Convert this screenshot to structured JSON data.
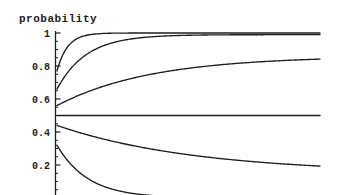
{
  "window": {
    "width": 345,
    "height": 195,
    "background": "#ffffff"
  },
  "colors": {
    "ink": "#1e1e1e"
  },
  "chart_data": {
    "type": "line",
    "title": "probability",
    "ylabel": "probability",
    "xlabel": "",
    "ylim": [
      0,
      1.02
    ],
    "grid": "off",
    "legend": "none",
    "x_axis": {
      "visible": false,
      "note": "x axis and its tick labels are cropped out of the visible image"
    },
    "y_axis": {
      "ticks": [
        {
          "value": 1.0,
          "label": "1"
        },
        {
          "value": 0.8,
          "label": "0.8"
        },
        {
          "value": 0.6,
          "label": "0.6"
        },
        {
          "value": 0.4,
          "label": "0.4"
        },
        {
          "value": 0.2,
          "label": "0.2"
        }
      ],
      "minor_tick_step": 0.05
    },
    "series": [
      {
        "name": "curve-start-0.77",
        "description": "rises steeply and saturates near 1",
        "start_value": 0.77,
        "end_value": 1.0,
        "asymptote": 1.0,
        "rate": 25,
        "x_range": [
          0,
          1
        ]
      },
      {
        "name": "curve-start-0.66",
        "description": "rises and approaches 1 more slowly",
        "start_value": 0.66,
        "end_value": 0.99,
        "asymptote": 0.99,
        "rate": 9,
        "x_range": [
          0,
          1
        ]
      },
      {
        "name": "curve-start-0.56",
        "description": "rises slowly toward ~0.84",
        "start_value": 0.56,
        "end_value": 0.84,
        "asymptote": 0.86,
        "rate": 2.8,
        "x_range": [
          0,
          1
        ]
      },
      {
        "name": "flat-line-0.5",
        "description": "horizontal line at probability 0.5",
        "start_value": 0.5,
        "end_value": 0.5,
        "asymptote": 0.5,
        "rate": 0,
        "x_range": [
          0,
          1
        ]
      },
      {
        "name": "curve-start-0.44",
        "description": "falls slowly toward ~0.19",
        "start_value": 0.44,
        "end_value": 0.19,
        "asymptote": 0.15,
        "rate": 1.9,
        "x_range": [
          0,
          1
        ]
      },
      {
        "name": "curve-start-0.32",
        "description": "falls steeply toward 0, exits bottom crop",
        "start_value": 0.32,
        "end_value": 0.01,
        "asymptote": 0.0,
        "rate": 8.5,
        "x_range": [
          0,
          0.42
        ]
      }
    ],
    "sample_x_fraction": [
      0,
      0.1,
      0.2,
      0.3,
      0.4,
      0.5,
      0.6,
      0.7,
      0.8,
      0.9,
      1.0
    ],
    "sample_values": {
      "curve-start-0.77": [
        0.77,
        0.981,
        0.998,
        1.0,
        1.0,
        1.0,
        1.0,
        1.0,
        1.0,
        1.0,
        1.0
      ],
      "curve-start-0.66": [
        0.66,
        0.856,
        0.936,
        0.968,
        0.981,
        0.986,
        0.989,
        0.989,
        0.99,
        0.99,
        0.99
      ],
      "curve-start-0.56": [
        0.56,
        0.633,
        0.688,
        0.73,
        0.762,
        0.785,
        0.803,
        0.817,
        0.827,
        0.835,
        0.84
      ],
      "flat-line-0.5": [
        0.5,
        0.5,
        0.5,
        0.5,
        0.5,
        0.5,
        0.5,
        0.5,
        0.5,
        0.5,
        0.5
      ],
      "curve-start-0.44": [
        0.44,
        0.39,
        0.348,
        0.314,
        0.285,
        0.272,
        0.238,
        0.222,
        0.209,
        0.199,
        0.19
      ],
      "curve-start-0.32": [
        0.32,
        0.137,
        0.058,
        0.025,
        0.011,
        null,
        null,
        null,
        null,
        null,
        null
      ]
    }
  }
}
